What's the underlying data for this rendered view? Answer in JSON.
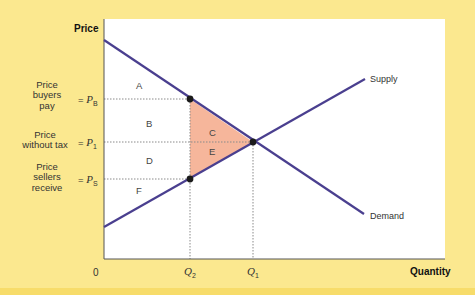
{
  "axes": {
    "y_label": "Price",
    "x_label": "Quantity",
    "origin": "0"
  },
  "price_levels": [
    {
      "key": "PB",
      "description": "Price buyers pay",
      "lines": [
        "Price",
        "buyers",
        "pay"
      ],
      "symbol": "P",
      "sub": "B",
      "y": 99
    },
    {
      "key": "P1",
      "description": "Price without tax",
      "lines": [
        "Price",
        "without tax"
      ],
      "symbol": "P",
      "sub": "1",
      "y": 142
    },
    {
      "key": "PS",
      "description": "Price sellers receive",
      "lines": [
        "Price",
        "sellers",
        "receive"
      ],
      "symbol": "P",
      "sub": "S",
      "y": 179
    }
  ],
  "quantity_levels": [
    {
      "key": "Q2",
      "symbol": "Q",
      "sub": "2",
      "x": 190
    },
    {
      "key": "Q1",
      "symbol": "Q",
      "sub": "1",
      "x": 253
    }
  ],
  "eq_sign": "=",
  "curves": {
    "supply": {
      "label": "Supply",
      "from": [
        104,
        227
      ],
      "to": [
        365,
        79
      ]
    },
    "demand": {
      "label": "Demand",
      "from": [
        104,
        40
      ],
      "to": [
        364,
        214
      ]
    }
  },
  "areas": {
    "A": "A",
    "B": "B",
    "C": "C",
    "D": "D",
    "E": "E",
    "F": "F"
  },
  "colors": {
    "background": "#fbe88f",
    "band": "#f7dc6a",
    "curve": "#4a3f8f",
    "deadweight_fill": "#f4a98a",
    "guide": "#8a8a8a",
    "dot": "#1a1a1a"
  }
}
